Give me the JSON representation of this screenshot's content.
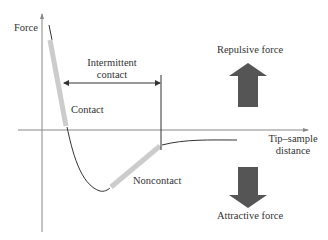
{
  "diagram": {
    "y_axis_label": "Force",
    "x_axis_label_line1": "Tip–sample",
    "x_axis_label_line2": "distance",
    "regions": {
      "contact": "Contact",
      "noncontact": "Noncontact",
      "intermittent_line1": "Intermittent",
      "intermittent_line2": "contact"
    },
    "forces": {
      "repulsive": "Repulsive force",
      "attractive": "Attractive force"
    },
    "colors": {
      "axis": "#888888",
      "curve": "#333333",
      "highlight": "#cccccc",
      "arrow_fill": "#555555",
      "text": "#333333"
    }
  }
}
